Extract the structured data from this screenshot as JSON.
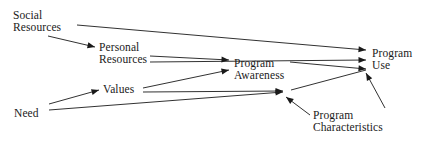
{
  "diagram": {
    "type": "path-diagram",
    "background_color": "#ffffff",
    "line_color": "#1a1a1a",
    "text_color": "#1a1a1a",
    "width": 428,
    "height": 145,
    "nodes": [
      {
        "id": "social_resources",
        "lines": [
          "Social",
          "Resources"
        ],
        "x": 13,
        "y": 9
      },
      {
        "id": "personal_resources",
        "lines": [
          "Personal",
          "Resources"
        ],
        "x": 99,
        "y": 41
      },
      {
        "id": "program_awareness",
        "lines": [
          "Program",
          "Awareness"
        ],
        "x": 234,
        "y": 57
      },
      {
        "id": "program_use",
        "lines": [
          "Program",
          "Use"
        ],
        "x": 372,
        "y": 47
      },
      {
        "id": "values",
        "lines": [
          "Values"
        ],
        "x": 103,
        "y": 83
      },
      {
        "id": "need",
        "lines": [
          "Need"
        ],
        "x": 14,
        "y": 107
      },
      {
        "id": "program_characteristics",
        "lines": [
          "Program",
          "Characteristics"
        ],
        "x": 313,
        "y": 109
      }
    ],
    "edges": [
      {
        "id": "social-to-personal",
        "from": "social_resources",
        "to": "personal_resources",
        "x1": 48,
        "y1": 36,
        "x2": 95,
        "y2": 47,
        "arrow": true
      },
      {
        "id": "social-to-programuse",
        "from": "social_resources",
        "to": "program_use",
        "x1": 77,
        "y1": 25,
        "x2": 366,
        "y2": 50,
        "arrow": true
      },
      {
        "id": "personal-to-programawareness",
        "from": "personal_resources",
        "to": "program_awareness",
        "x1": 150,
        "y1": 56,
        "x2": 229,
        "y2": 60,
        "arrow": true
      },
      {
        "id": "personal-to-programuse",
        "from": "personal_resources",
        "to": "program_use",
        "x1": 150,
        "y1": 62,
        "x2": 366,
        "y2": 60,
        "arrow": true
      },
      {
        "id": "programawareness-to-programuse",
        "from": "program_awareness",
        "to": "program_use",
        "x1": 290,
        "y1": 62,
        "x2": 366,
        "y2": 69,
        "arrow": true
      },
      {
        "id": "need-to-values",
        "from": "need",
        "to": "values",
        "x1": 49,
        "y1": 104,
        "x2": 99,
        "y2": 90,
        "arrow": true
      },
      {
        "id": "values-to-programawareness",
        "from": "values",
        "to": "program_awareness",
        "x1": 143,
        "y1": 88,
        "x2": 229,
        "y2": 70,
        "arrow": true
      },
      {
        "id": "values-to-junction",
        "from": "values",
        "to": "junction",
        "x1": 143,
        "y1": 92,
        "x2": 283,
        "y2": 91,
        "arrow": true
      },
      {
        "id": "need-to-junction",
        "from": "need",
        "to": "junction",
        "x1": 49,
        "y1": 110,
        "x2": 283,
        "y2": 92,
        "arrow": true
      },
      {
        "id": "characteristics-to-junction",
        "from": "program_characteristics",
        "to": "junction",
        "x1": 310,
        "y1": 115,
        "x2": 286,
        "y2": 97,
        "arrow": true
      },
      {
        "id": "junction-to-programuse",
        "from": "junction",
        "to": "program_use",
        "x1": 291,
        "y1": 90,
        "x2": 366,
        "y2": 70,
        "arrow": false
      },
      {
        "id": "characteristics-to-programuse",
        "from": "program_characteristics",
        "to": "program_use",
        "x1": 385,
        "y1": 108,
        "x2": 366,
        "y2": 73,
        "arrow": true
      }
    ]
  }
}
